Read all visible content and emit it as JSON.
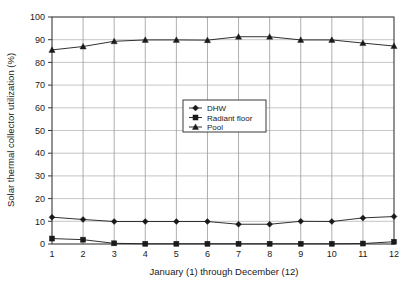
{
  "chart_data": {
    "type": "line",
    "title": "",
    "xlabel": "January (1) through December (12)",
    "ylabel": "Solar thermal collector utilization (%)",
    "x": [
      1,
      2,
      3,
      4,
      5,
      6,
      7,
      8,
      9,
      10,
      11,
      12
    ],
    "xtick_labels": [
      "1",
      "2",
      "3",
      "4",
      "5",
      "6",
      "7",
      "8",
      "9",
      "10",
      "11",
      "12"
    ],
    "ytick_labels": [
      "0",
      "10",
      "20",
      "30",
      "40",
      "50",
      "60",
      "70",
      "80",
      "90",
      "100"
    ],
    "ytick_values": [
      0,
      10,
      20,
      30,
      40,
      50,
      60,
      70,
      80,
      90,
      100
    ],
    "xlim": [
      1,
      12
    ],
    "ylim": [
      0,
      100
    ],
    "grid": true,
    "legend_position": "center",
    "series": [
      {
        "name": "DHW",
        "marker": "diamond",
        "color": "#1a1a1a",
        "values": [
          11.8,
          10.8,
          9.9,
          9.9,
          9.9,
          9.9,
          8.7,
          8.7,
          10.0,
          9.9,
          11.5,
          12.1
        ]
      },
      {
        "name": "Radiant floor",
        "marker": "square",
        "color": "#1a1a1a",
        "values": [
          2.4,
          1.9,
          0.3,
          0.1,
          0.1,
          0.1,
          0.1,
          0.1,
          0.1,
          0.1,
          0.2,
          1.0
        ]
      },
      {
        "name": "Pool",
        "marker": "triangle",
        "color": "#1a1a1a",
        "values": [
          85.5,
          87.0,
          89.3,
          89.9,
          89.9,
          89.8,
          91.3,
          91.3,
          89.9,
          89.9,
          88.5,
          87.2
        ]
      }
    ]
  },
  "legend": {
    "entries": [
      {
        "label": "DHW"
      },
      {
        "label": "Radiant floor"
      },
      {
        "label": "Pool"
      }
    ]
  },
  "style": {
    "frame_color": "#3a3a3a",
    "grid_color": "#b8b8b8",
    "series_color": "#1a1a1a",
    "background": "#ffffff"
  }
}
